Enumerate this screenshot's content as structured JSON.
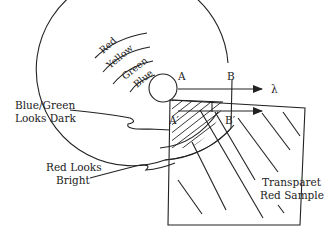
{
  "diagram": {
    "ring_labels": {
      "red": "Red",
      "yellow": "Yellow",
      "green": "Green",
      "blue": "Blue"
    },
    "points": {
      "a": "A",
      "b": "B",
      "a_prime": "A′",
      "b_prime": "B′"
    },
    "wavelength_symbol": "λ",
    "callouts": {
      "blue_green_line1": "Blue/Green",
      "blue_green_line2": "Looks Dark",
      "red_line1": "Red Looks",
      "red_line2": "Bright"
    },
    "sample_label_line1": "Transparet",
    "sample_label_line2": "Red Sample",
    "colors": {
      "line": "#222222",
      "background": "#ffffff"
    }
  }
}
